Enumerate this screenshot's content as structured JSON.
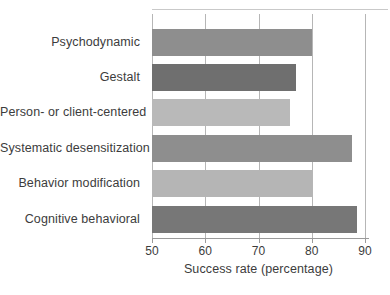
{
  "colors": {
    "background": "#ffffff",
    "gridline": "#b6b6b6",
    "axis": "#9a9a9a",
    "text": "#3c3c3c",
    "top_rule": "#c9c9c9"
  },
  "chart_data": {
    "type": "bar",
    "orientation": "horizontal",
    "categories": [
      "Psychodynamic",
      "Gestalt",
      "Person- or client-centered",
      "Systematic desensitization",
      "Behavior modification",
      "Cognitive behavioral"
    ],
    "values": [
      80,
      77,
      76,
      87.5,
      80,
      88.5
    ],
    "bar_colors": [
      "#8e8e8e",
      "#6f6f6f",
      "#b9b9b9",
      "#8e8e8e",
      "#b5b5b5",
      "#777777"
    ],
    "xlabel": "Success rate (percentage)",
    "x_ticks": [
      50,
      60,
      70,
      80,
      90
    ],
    "xlim": [
      50,
      90
    ],
    "grid": true,
    "legend": false,
    "title": ""
  }
}
